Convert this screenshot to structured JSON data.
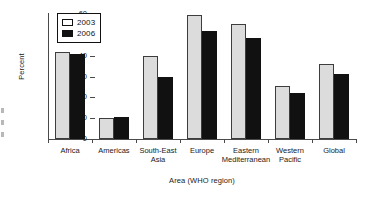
{
  "chart_data": {
    "type": "bar",
    "title": "",
    "xlabel": "Area (WHO region)",
    "ylabel": "Percent",
    "ylim": [
      0,
      60
    ],
    "yticks": [
      0,
      10,
      20,
      30,
      40,
      50,
      60
    ],
    "grid": false,
    "legend_position": "top-left-inside",
    "categories": [
      "Africa",
      "Americas",
      "South-East Asia",
      "Europe",
      "Eastern Mediterranean",
      "Western Pacific",
      "Global"
    ],
    "category_lines": [
      [
        "Africa"
      ],
      [
        "Americas"
      ],
      [
        "South-East",
        "Asia"
      ],
      [
        "Europe"
      ],
      [
        "Eastern",
        "Mediterranean"
      ],
      [
        "Western",
        "Pacific"
      ],
      [
        "Global"
      ]
    ],
    "series": [
      {
        "name": "2003",
        "color": "#dcdcdc",
        "values": [
          42,
          10,
          40,
          59.5,
          55,
          25.5,
          36
        ]
      },
      {
        "name": "2006",
        "color": "#111111",
        "values": [
          41,
          10.5,
          30,
          52,
          48.5,
          22,
          31
        ]
      }
    ]
  },
  "legend": {
    "entries": [
      {
        "label": "2003"
      },
      {
        "label": "2006"
      }
    ]
  }
}
